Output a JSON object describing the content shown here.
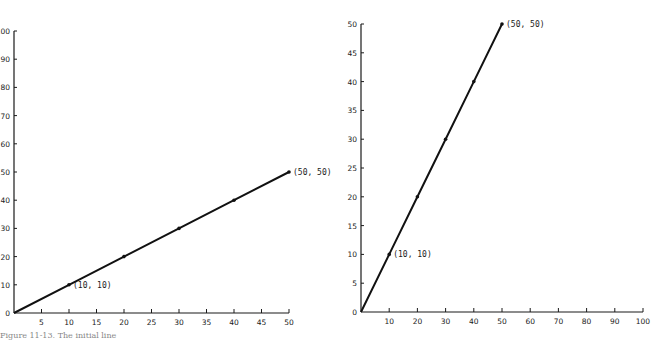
{
  "chart_data": [
    {
      "type": "line",
      "title": "",
      "xlabel": "",
      "ylabel": "",
      "xlim": [
        0,
        50
      ],
      "ylim": [
        0,
        100
      ],
      "x_ticks": [
        5,
        10,
        15,
        20,
        25,
        30,
        35,
        40,
        45,
        50
      ],
      "y_ticks": [
        0,
        10,
        20,
        30,
        40,
        50,
        60,
        70,
        80,
        90,
        100
      ],
      "grid": false,
      "legend": null,
      "series": [
        {
          "name": "line",
          "x": [
            0,
            10,
            20,
            30,
            40,
            50
          ],
          "y": [
            0,
            10,
            20,
            30,
            40,
            50
          ]
        }
      ],
      "annotations": [
        {
          "text": "(10, 10)",
          "x": 10,
          "y": 10
        },
        {
          "text": "(50, 50)",
          "x": 50,
          "y": 50
        }
      ]
    },
    {
      "type": "line",
      "title": "",
      "xlabel": "",
      "ylabel": "",
      "xlim": [
        0,
        100
      ],
      "ylim": [
        0,
        50
      ],
      "x_ticks": [
        10,
        20,
        30,
        40,
        50,
        60,
        70,
        80,
        90,
        100
      ],
      "y_ticks": [
        0,
        5,
        10,
        15,
        20,
        25,
        30,
        35,
        40,
        45,
        50
      ],
      "grid": false,
      "legend": null,
      "series": [
        {
          "name": "line",
          "x": [
            0,
            10,
            20,
            30,
            40,
            50
          ],
          "y": [
            0,
            10,
            20,
            30,
            40,
            50
          ]
        }
      ],
      "annotations": [
        {
          "text": "(10, 10)",
          "x": 10,
          "y": 10
        },
        {
          "text": "(50, 50)",
          "x": 50,
          "y": 50
        }
      ]
    }
  ],
  "caption": "Figure 11-13.  The initial line"
}
